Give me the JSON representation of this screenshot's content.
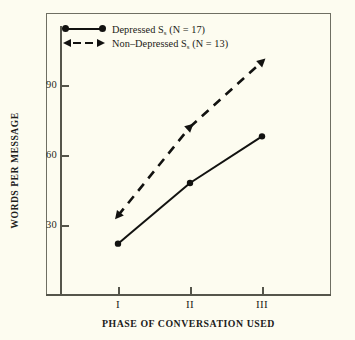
{
  "chart_data": {
    "type": "line",
    "title": "",
    "xlabel": "PHASE OF CONVERSATION USED",
    "ylabel": "WORDS PER MESSAGE",
    "categories": [
      "I",
      "II",
      "III"
    ],
    "xtick_labels": [
      "I",
      "II",
      "III"
    ],
    "ytick_labels": [
      "30",
      "60",
      "90"
    ],
    "yticks": [
      30,
      60,
      90
    ],
    "ylim": [
      8,
      112
    ],
    "grid": false,
    "legend_position": "top-left",
    "series": [
      {
        "name": "Depressed Sₛ (N = 17)",
        "label_main": "Depressed S",
        "label_sub": "s",
        "label_tail": " (N = 17)",
        "n": 17,
        "line_style": "solid",
        "marker": "circle",
        "color": "#121210",
        "values": [
          22,
          48,
          68
        ]
      },
      {
        "name": "Non–Depressed Sₛ (N = 13)",
        "label_main": "Non–Depressed S",
        "label_sub": "s",
        "label_tail": " (N = 13)",
        "n": 13,
        "line_style": "dashed",
        "marker": "triangle",
        "color": "#121210",
        "values": [
          34,
          72,
          100
        ]
      }
    ]
  },
  "figure": {
    "background_color": "#fdfcf0",
    "axis_color": "#55554b",
    "frame_color": "#6f6f63",
    "text_color": "#1b1b15"
  },
  "legend": {
    "rows": [
      {
        "label_main": "Depressed S",
        "label_sub": "s",
        "label_tail": " (N = 17)"
      },
      {
        "label_main": "Non–Depressed S",
        "label_sub": "s",
        "label_tail": " (N = 13)"
      }
    ]
  },
  "axes": {
    "y_title": "WORDS PER MESSAGE",
    "x_title": "PHASE OF CONVERSATION USED",
    "y_labels": [
      "90",
      "60",
      "30"
    ],
    "x_labels": [
      "I",
      "II",
      "III"
    ]
  }
}
